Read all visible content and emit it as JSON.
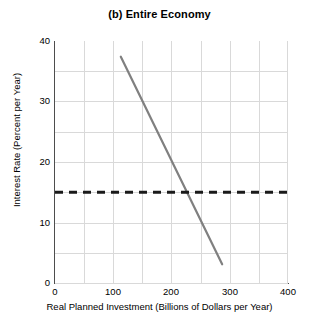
{
  "chart_data": {
    "type": "line",
    "title": "(b) Entire Economy",
    "xlabel": "Real Planned Investment (Billions of Dollars per Year)",
    "ylabel": "Interest Rate (Percent per Year)",
    "xlim": [
      0,
      400
    ],
    "ylim": [
      0,
      40
    ],
    "xticks": [
      0,
      100,
      200,
      300,
      400
    ],
    "yticks": [
      0,
      10,
      20,
      30,
      40
    ],
    "xtick_labels": [
      "0",
      "100",
      "200",
      "300",
      "400"
    ],
    "ytick_labels": [
      "0",
      "10",
      "20",
      "30",
      "40"
    ],
    "grid": true,
    "grid_step_x": 50,
    "grid_step_y": 5,
    "grid_color": "#d9d9d9",
    "legend": null,
    "series": [
      {
        "name": "Investment Demand",
        "style": "solid",
        "color": "#808080",
        "width": 2.2,
        "x": [
          113,
          287
        ],
        "values": [
          37.4,
          3.1
        ]
      },
      {
        "name": "Interest Rate",
        "style": "dashed",
        "color": "#1a1a1a",
        "width": 3,
        "x": [
          0,
          400
        ],
        "values": [
          15,
          15
        ]
      }
    ],
    "intersection": {
      "x": 230,
      "y": 15
    }
  }
}
